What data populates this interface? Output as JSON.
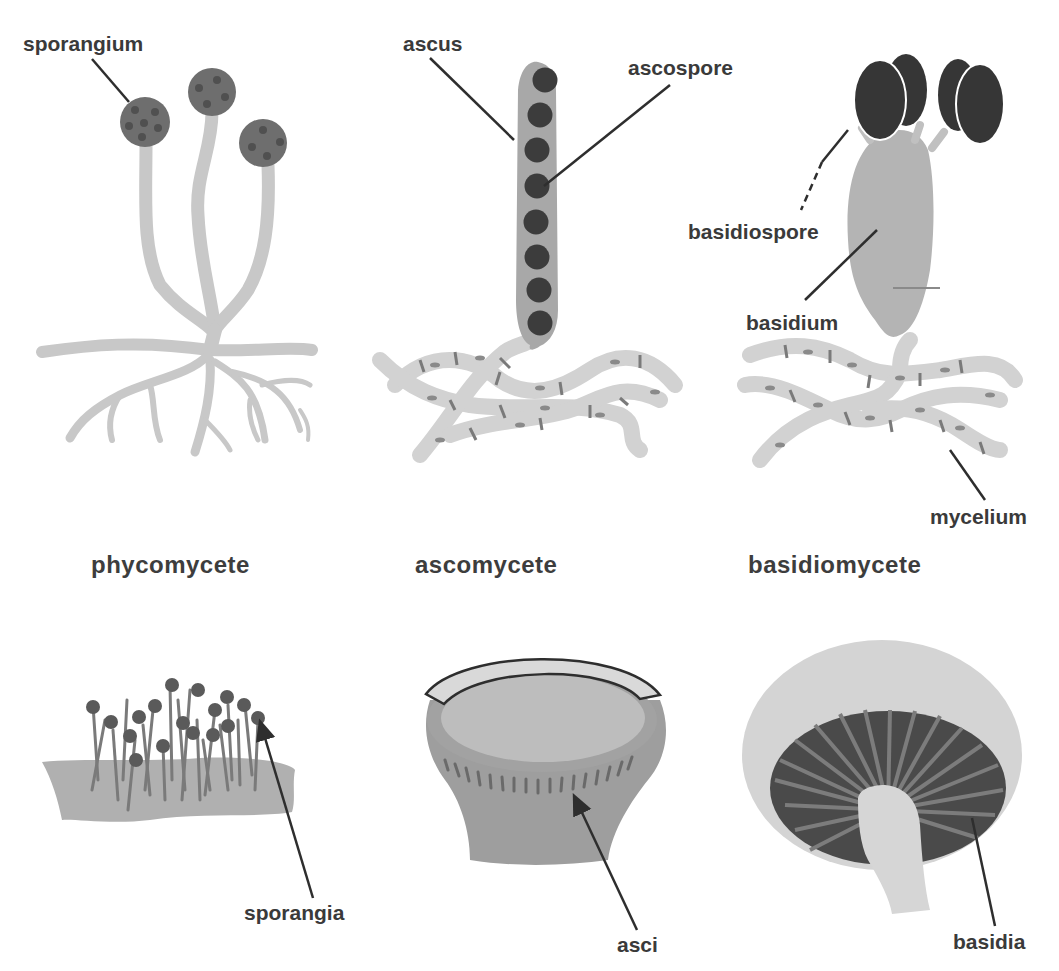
{
  "diagram": {
    "type": "biology-illustration",
    "columns": [
      {
        "title": "phycomycete",
        "top_labels": [
          "sporangium"
        ],
        "bottom_labels": [
          "sporangia"
        ]
      },
      {
        "title": "ascomycete",
        "top_labels": [
          "ascus",
          "ascospore"
        ],
        "bottom_labels": [
          "asci"
        ]
      },
      {
        "title": "basidiomycete",
        "top_labels": [
          "basidiospore",
          "basidium",
          "mycelium"
        ],
        "bottom_labels": [
          "basidia"
        ]
      }
    ],
    "colors": {
      "background": "#ffffff",
      "hyphae": "#c8c8c8",
      "sporangium": "#6e6e6e",
      "spore_dark": "#3a3a3a",
      "ascus": "#a8a8a8",
      "basidium": "#b4b4b4",
      "label_text": "#3a3a3a",
      "leader_line": "#2e2e2e"
    }
  }
}
